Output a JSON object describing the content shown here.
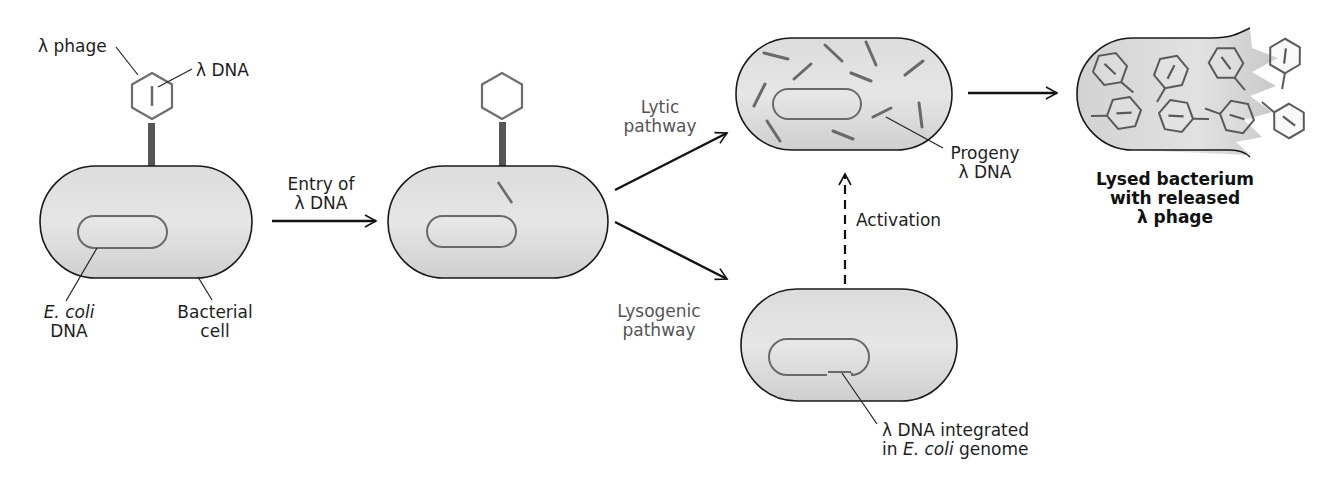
{
  "figure": {
    "colors": {
      "cell_fill_light": "#e4e4e4",
      "cell_fill_dark": "#c9c9c9",
      "outline": "#1a1a1a",
      "dna": "#6a6a6a",
      "phage_outline": "#6e6e6e",
      "phage_tail": "#555555",
      "arrow": "#111111",
      "label_gray": "#555555"
    }
  },
  "labels": {
    "lambda_phage": "λ phage",
    "lambda_dna": "λ DNA",
    "ecoli_italic": "E. coli",
    "ecoli_dna_suffix": "DNA",
    "bacterial_line1": "Bacterial",
    "bacterial_line2": "cell",
    "entry_line1": "Entry of",
    "entry_line2": "λ DNA",
    "lytic_line1": "Lytic",
    "lytic_line2": "pathway",
    "lysogenic_line1": "Lysogenic",
    "lysogenic_line2": "pathway",
    "progeny_line1": "Progeny",
    "progeny_line2": "λ DNA",
    "activation": "Activation",
    "integrated_line1": "λ DNA integrated",
    "integrated_prefix": "in ",
    "integrated_italic": "E. coli",
    "integrated_suffix": " genome",
    "lysed_line1": "Lysed bacterium",
    "lysed_line2": "with released",
    "lysed_line3": "λ phage"
  },
  "stages": [
    {
      "id": "infection",
      "description": "λ phage attached to bacterial cell"
    },
    {
      "id": "entry",
      "description": "λ DNA injected into cell"
    },
    {
      "id": "lytic",
      "description": "Progeny λ DNA replicated in cell"
    },
    {
      "id": "lysogenic",
      "description": "λ DNA integrated in E. coli genome"
    },
    {
      "id": "lysis",
      "description": "Lysed bacterium with released λ phage"
    }
  ]
}
